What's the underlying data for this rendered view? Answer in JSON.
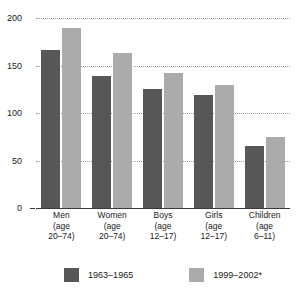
{
  "chart_data": {
    "type": "bar",
    "title": "",
    "subtitle": "",
    "xlabel": "",
    "ylabel": "",
    "ylim": [
      0,
      200
    ],
    "yticks": [
      0,
      50,
      100,
      150,
      200
    ],
    "ytick_labels": [
      "0",
      "50",
      "100",
      "150",
      "200"
    ],
    "grid": true,
    "legend_position": "bottom",
    "categories": [
      "Men\n(age\n20–74)",
      "Women\n(age\n20–74)",
      "Boys\n(age\n12–17)",
      "Girls\n(age\n12–17)",
      "Children\n(age\n6–11)"
    ],
    "category_lines": [
      [
        "Men",
        "(age",
        "20–74)"
      ],
      [
        "Women",
        "(age",
        "20–74)"
      ],
      [
        "Boys",
        "(age",
        "12–17)"
      ],
      [
        "Girls",
        "(age",
        "12–17)"
      ],
      [
        "Children",
        "(age",
        "6–11)"
      ]
    ],
    "series": [
      {
        "name": "1963–1965",
        "color": "#575757",
        "values": [
          166,
          139,
          125,
          119,
          65
        ]
      },
      {
        "name": "1999–2002*",
        "color": "#ababab",
        "values": [
          190,
          163,
          142,
          130,
          75
        ]
      }
    ]
  },
  "axis": {
    "baseline_label": "0"
  },
  "colors": {
    "series_dark": "#575757",
    "series_light": "#ababab",
    "gridline": "#9a9a9a",
    "axis": "#3a3a3a",
    "background": "#ffffff"
  }
}
